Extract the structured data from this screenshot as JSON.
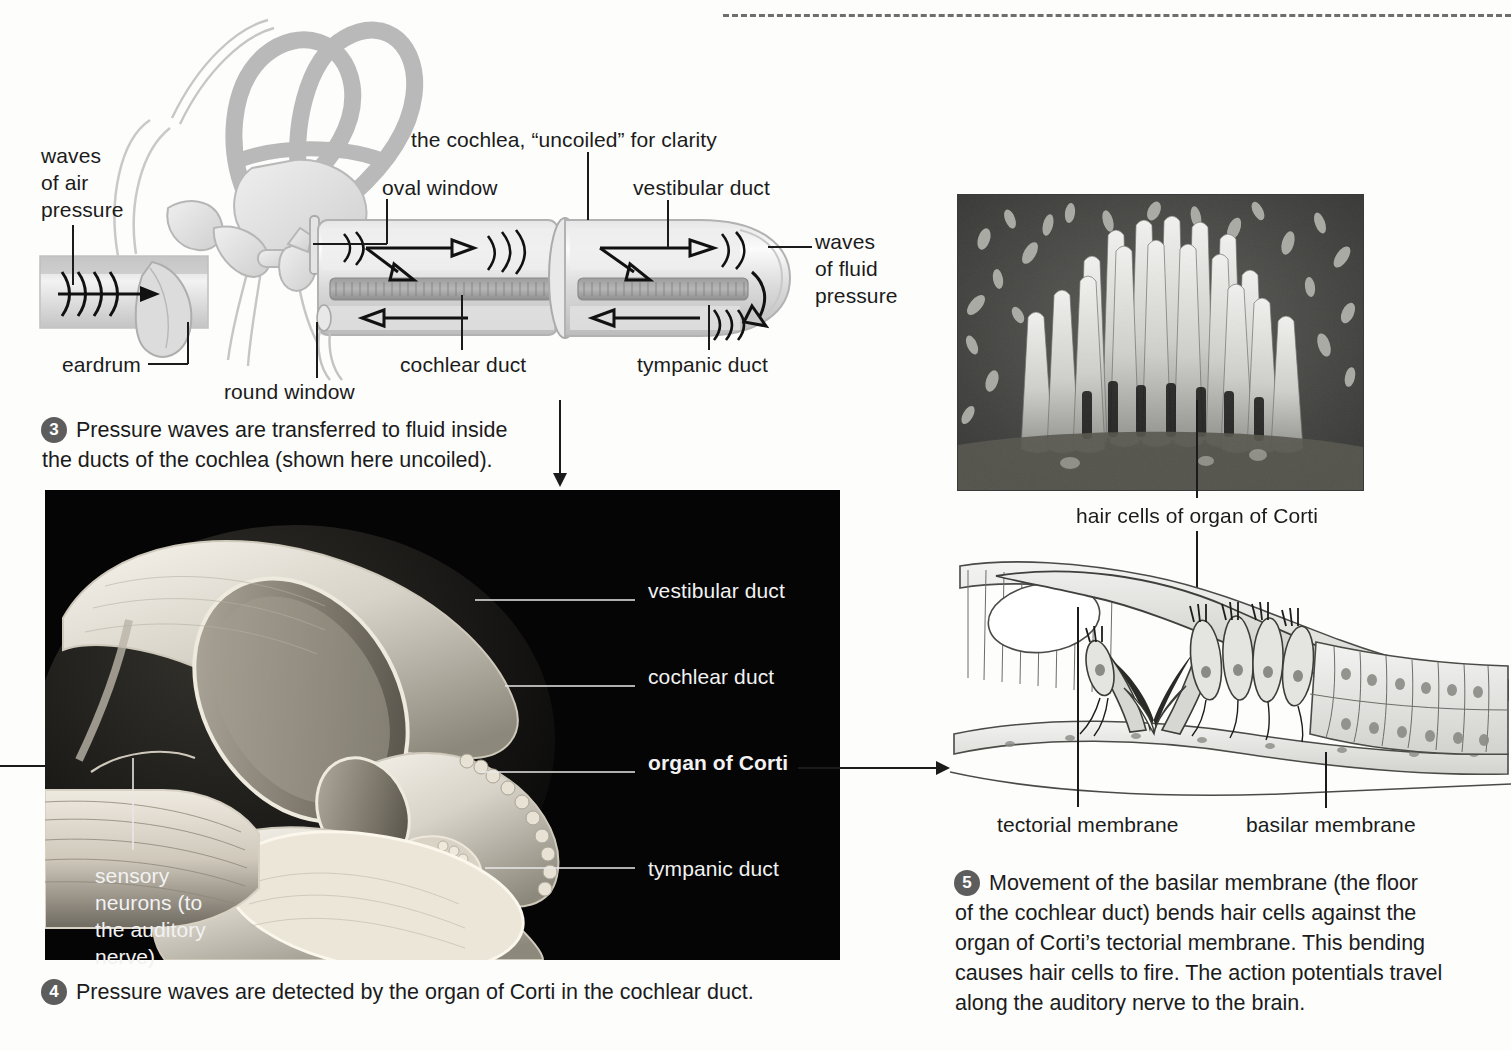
{
  "figure": {
    "domain": "biology-anatomy-diagram"
  },
  "top_diagram": {
    "title_label": "the cochlea, “uncoiled” for clarity",
    "labels": {
      "waves_of_air_pressure": "waves\nof air\npressure",
      "waves_of_air_pressure_lines": [
        "waves",
        "of air",
        "pressure"
      ],
      "eardrum": "eardrum",
      "round_window": "round window",
      "oval_window": "oval window",
      "cochlear_duct": "cochlear duct",
      "vestibular_duct": "vestibular duct",
      "tympanic_duct": "tympanic duct",
      "waves_of_fluid_pressure_lines": [
        "waves",
        "of fluid",
        "pressure"
      ]
    }
  },
  "steps": [
    {
      "number": "3",
      "text": "Pressure waves are transferred to fluid inside the ducts of the cochlea (shown here uncoiled).",
      "lines": [
        "Pressure waves are transferred to fluid inside",
        "the ducts of the cochlea (shown here uncoiled)."
      ]
    },
    {
      "number": "4",
      "text": "Pressure waves are detected by the organ of Corti in the cochlear duct.",
      "lines": [
        "Pressure waves are detected by the organ of Corti in the cochlear duct."
      ]
    },
    {
      "number": "5",
      "text": "Movement of the basilar membrane (the floor of the cochlear duct) bends hair cells against the organ of Corti's tectorial membrane. This bending causes hair cells to fire. The action potentials travel along the auditory nerve to the brain.",
      "lines": [
        "Movement of the basilar membrane (the floor",
        "of the cochlear duct) bends hair cells against the",
        "organ of Corti’s tectorial membrane. This bending",
        "causes hair cells to fire. The action potentials travel",
        "along the auditory nerve to the brain."
      ]
    }
  ],
  "cutaway_panel": {
    "background_color": "#050505",
    "labels": {
      "vestibular_duct": "vestibular duct",
      "cochlear_duct": "cochlear duct",
      "organ_of_corti": "organ of Corti",
      "tympanic_duct": "tympanic duct",
      "sensory_neurons_lines": [
        "sensory",
        "neurons (to",
        "the auditory",
        "nerve)"
      ],
      "sensory_neurons": "sensory neurons (to the auditory nerve)"
    }
  },
  "micrograph_panel": {
    "caption": "hair cells of organ of Corti",
    "description": "scanning electron micrograph of a hair cell stereocilia bundle"
  },
  "cross_section_panel": {
    "labels": {
      "tectorial_membrane": "tectorial membrane",
      "basilar_membrane": "basilar membrane"
    }
  },
  "colors": {
    "page_background": "#fdfdfc",
    "ink": "#1b1b1b",
    "panel_black": "#050505",
    "step_marker": "#5d5d5d",
    "label_white": "#f2f2f2",
    "dashed_rule": "#6e6e6e"
  }
}
